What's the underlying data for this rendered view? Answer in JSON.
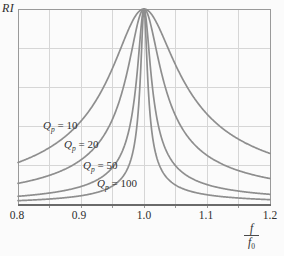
{
  "page": {
    "background": "#fbfbfb"
  },
  "figure": {
    "y_axis_title": "RI",
    "x_axis_fraction": {
      "numerator": "f",
      "denominator_base": "f",
      "denominator_sub": "0"
    }
  },
  "chart_data": {
    "type": "line",
    "title": "",
    "ylabel": "RI",
    "xlabel_display": "f/f0",
    "xlim": [
      0.8,
      1.2
    ],
    "ylim": [
      0,
      1
    ],
    "grid": true,
    "x_grid_step": 0.05,
    "y_grid_step": 0.2,
    "x_ticks": [
      "0.8",
      "0.9",
      "1.0",
      "1.1",
      "1.2"
    ],
    "x_tick_values": [
      0.8,
      0.9,
      1.0,
      1.1,
      1.2
    ],
    "x": [
      0.8,
      0.85,
      0.9,
      0.95,
      1.0,
      1.05,
      1.1,
      1.15,
      1.2
    ],
    "series": [
      {
        "name": "Qp = 10",
        "Qp": 10,
        "values": [
          0.217,
          0.293,
          0.428,
          0.698,
          1.0,
          0.716,
          0.464,
          0.336,
          0.263
        ]
      },
      {
        "name": "Qp = 20",
        "Qp": 20,
        "values": [
          0.11,
          0.151,
          0.23,
          0.438,
          1.0,
          0.456,
          0.253,
          0.176,
          0.135
        ]
      },
      {
        "name": "Qp = 50",
        "Qp": 50,
        "values": [
          0.044,
          0.061,
          0.094,
          0.191,
          1.0,
          0.201,
          0.104,
          0.071,
          0.055
        ]
      },
      {
        "name": "Qp = 100",
        "Qp": 100,
        "values": [
          0.022,
          0.031,
          0.047,
          0.097,
          1.0,
          0.102,
          0.052,
          0.036,
          0.027
        ]
      }
    ],
    "formula": "RI = 1 / sqrt(1 + Qp^2 * (f/f0 - f0/f)^2)",
    "legend_position": "on-curve-left",
    "colors": {
      "curve": "#8e8e8e",
      "grid": "#d6d6d6",
      "frame": "#9a9a9a",
      "axis": "#6a6a6a",
      "text": "#2e2e2e"
    }
  },
  "curve_labels": [
    {
      "base": "Q",
      "sub": "p",
      "rest": " = 10"
    },
    {
      "base": "Q",
      "sub": "p",
      "rest": " = 20"
    },
    {
      "base": "Q",
      "sub": "p",
      "rest": " = 50"
    },
    {
      "base": "Q",
      "sub": "p",
      "rest": " = 100"
    }
  ]
}
